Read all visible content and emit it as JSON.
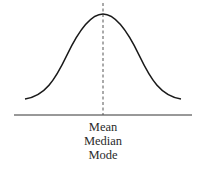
{
  "diagram": {
    "type": "normal-distribution",
    "labels": [
      "Mean",
      "Median",
      "Mode"
    ],
    "colors": {
      "curve": "#1a1a1a",
      "axis": "#333333",
      "center_line": "#555555"
    }
  }
}
